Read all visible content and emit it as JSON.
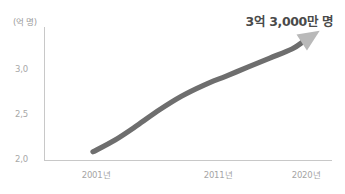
{
  "chart_data": {
    "type": "line",
    "title": "",
    "subtitle": "",
    "xlabel": "",
    "ylabel": "(억 명)",
    "yunit": "(억 명)",
    "xlim": [
      2001,
      2020
    ],
    "ylim": [
      2.0,
      3.4
    ],
    "grid": false,
    "legend": false,
    "legend_position": "none",
    "annotations": [
      {
        "text": "3억 3,000만 명",
        "position": "top-right",
        "refers_to_value": 3.3
      }
    ],
    "y_ticks": [
      "2,0",
      "2,5",
      "3,0"
    ],
    "y_tick_values": [
      2.0,
      2.5,
      3.0
    ],
    "x_ticks": [
      "2001년",
      "2011년",
      "2020년"
    ],
    "x_tick_values": [
      2001,
      2011,
      2020
    ],
    "series": [
      {
        "name": "인구",
        "style": "thick-arrow-line",
        "color": "#6e6e6e",
        "arrowhead_color": "#b9b9b9",
        "x": [
          2001,
          2003,
          2005,
          2007,
          2009,
          2011,
          2013,
          2015,
          2017,
          2019,
          2020
        ],
        "values": [
          2.09,
          2.22,
          2.38,
          2.55,
          2.7,
          2.82,
          2.92,
          3.02,
          3.12,
          3.22,
          3.3
        ]
      }
    ]
  },
  "axes": {
    "unit_label": "(억 명)",
    "y_ticks": [
      {
        "label": "3,0",
        "value": 3.0
      },
      {
        "label": "2,5",
        "value": 2.5
      },
      {
        "label": "2,0",
        "value": 2.0
      }
    ],
    "x_ticks": [
      {
        "label": "2001년",
        "value": 2001
      },
      {
        "label": "2011년",
        "value": 2011
      },
      {
        "label": "2020년",
        "value": 2020
      }
    ]
  },
  "callout": {
    "value_text": "3억 3,000만 명"
  },
  "colors": {
    "line": "#6e6e6e",
    "arrowhead": "#b9b9b9",
    "axis": "#c8c8c8",
    "tick_text": "#a5a5a5",
    "annotation_text": "#4a4a4a",
    "background": "#ffffff"
  }
}
